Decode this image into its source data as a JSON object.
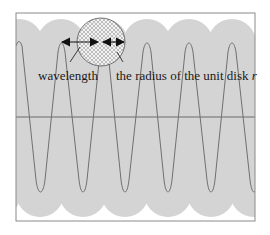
{
  "diagram": {
    "labels": {
      "wavelength": "wavelength",
      "radius": "the radius of the unit disk ",
      "radius_symbol": "r"
    },
    "colors": {
      "background": "#ffffff",
      "band_fill": "#d4d4d4",
      "frame": "#8a8a8a",
      "wave": "#707070",
      "axis": "#6a6a6a",
      "arrow": "#111111",
      "disk_fill": "#eeeeee"
    },
    "wave": {
      "peaks_x": [
        19,
        61,
        104,
        147,
        189,
        232
      ],
      "period_px": 43,
      "peak_y": 43,
      "trough_y": 193,
      "center_y": 117
    },
    "unit_disk": {
      "cx": 101,
      "cy": 42,
      "r": 24
    }
  }
}
